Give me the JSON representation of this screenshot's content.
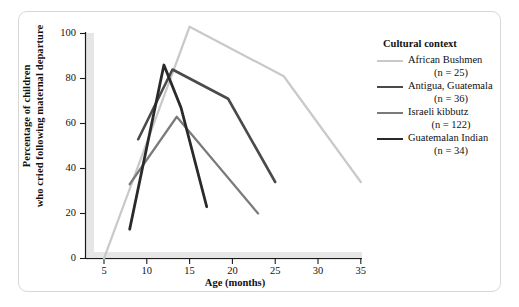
{
  "figure": {
    "background": "#ffffff",
    "frame_color": "#d8d8d8"
  },
  "axis": {
    "x_title": "Age (months)",
    "y_title_line1": "Percentage of children",
    "y_title_line2": "who cried following maternal departure",
    "x_ticks": [
      "5",
      "10",
      "15",
      "20",
      "25",
      "30",
      "35"
    ],
    "y_ticks": [
      "0",
      "20",
      "40",
      "60",
      "80",
      "100"
    ],
    "axis_color": "#1a1a1a",
    "axis_shadow_color": "#e3e3e3"
  },
  "legend": {
    "title": "Cultural context",
    "entries": [
      {
        "label": "African Bushmen",
        "n_text": "(n = 25)",
        "color": "#c9c9c9",
        "width": 2.2
      },
      {
        "label": "Antigua, Guatemala",
        "n_text": "(n = 36)",
        "color": "#4a4a4a",
        "width": 2.6
      },
      {
        "label": "Israeli kibbutz",
        "n_text": "(n = 122)",
        "color": "#7a7a7a",
        "width": 2.2
      },
      {
        "label": "Guatemalan Indian",
        "n_text": "(n = 34)",
        "color": "#2a2a2a",
        "width": 2.8
      }
    ]
  },
  "chart_data": {
    "type": "line",
    "title": "",
    "xlabel": "Age (months)",
    "ylabel": "Percentage of children who cried following maternal departure",
    "xlim": [
      3,
      35
    ],
    "ylim": [
      0,
      100
    ],
    "xticks": [
      5,
      10,
      15,
      20,
      25,
      30,
      35
    ],
    "yticks": [
      0,
      20,
      40,
      60,
      80,
      100
    ],
    "grid": false,
    "legend_position": "right",
    "legend_title": "Cultural context",
    "series": [
      {
        "name": "African Bushmen",
        "n": 25,
        "color": "#c9c9c9",
        "x": [
          5,
          15,
          26,
          35
        ],
        "y": [
          0,
          103,
          81,
          34
        ]
      },
      {
        "name": "Antigua, Guatemala",
        "n": 36,
        "color": "#4a4a4a",
        "x": [
          9,
          13,
          19.5,
          25
        ],
        "y": [
          53,
          84,
          71,
          34
        ]
      },
      {
        "name": "Israeli kibbutz",
        "n": 122,
        "color": "#7a7a7a",
        "x": [
          8,
          13.5,
          23
        ],
        "y": [
          33,
          63,
          20
        ]
      },
      {
        "name": "Guatemalan Indian",
        "n": 34,
        "color": "#2a2a2a",
        "x": [
          8,
          12,
          14,
          17
        ],
        "y": [
          13,
          86,
          67,
          23
        ]
      }
    ]
  }
}
